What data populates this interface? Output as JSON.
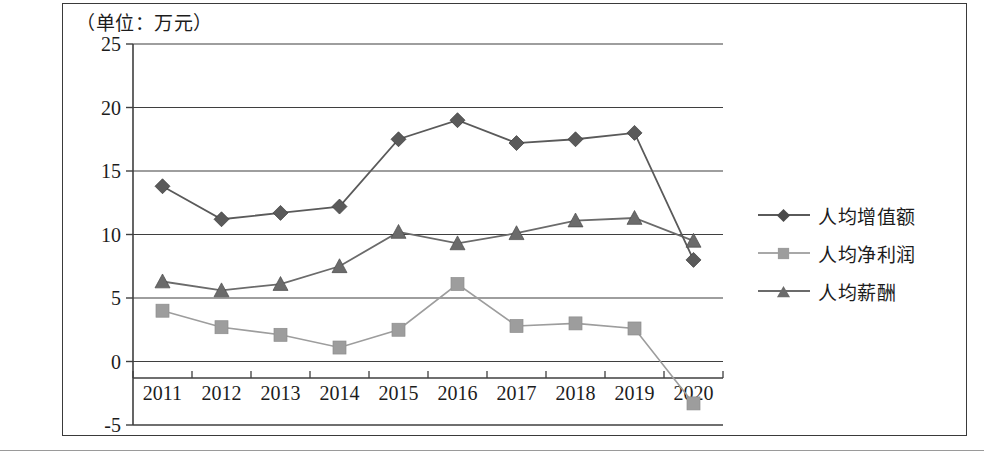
{
  "figure": {
    "unit_note": "（单位：万元）"
  },
  "chart_data": {
    "type": "line",
    "title": "",
    "subtitle": "",
    "xlabel": "",
    "ylabel": "",
    "unit": "万元",
    "categories": [
      "2011",
      "2012",
      "2013",
      "2014",
      "2015",
      "2016",
      "2017",
      "2018",
      "2019",
      "2020"
    ],
    "ylim": [
      -5,
      25
    ],
    "yticks": [
      "-5",
      "0",
      "5",
      "10",
      "15",
      "20",
      "25"
    ],
    "ytick_values": [
      -5,
      0,
      5,
      10,
      15,
      20,
      25
    ],
    "grid": true,
    "legend_position": "right",
    "series": [
      {
        "name": "人均增值额",
        "marker": "diamond",
        "color": "#5a5a5a",
        "values": [
          13.8,
          11.2,
          11.7,
          12.2,
          17.5,
          19.0,
          17.2,
          17.5,
          18.0,
          8.0
        ]
      },
      {
        "name": "人均净利润",
        "marker": "square",
        "color": "#9d9d9d",
        "values": [
          4.0,
          2.7,
          2.1,
          1.1,
          2.5,
          6.1,
          2.8,
          3.0,
          2.6,
          -3.3
        ]
      },
      {
        "name": "人均薪酬",
        "marker": "triangle",
        "color": "#6b6b6b",
        "values": [
          6.3,
          5.6,
          6.1,
          7.5,
          10.2,
          9.3,
          10.1,
          11.1,
          11.3,
          9.5
        ]
      }
    ]
  },
  "axes": {
    "x_labels": [
      "2011",
      "2012",
      "2013",
      "2014",
      "2015",
      "2016",
      "2017",
      "2018",
      "2019",
      "2020"
    ],
    "y_labels": [
      "25",
      "20",
      "15",
      "10",
      "5",
      "0",
      "-5"
    ]
  },
  "legend": {
    "items": [
      {
        "label": "人均增值额",
        "marker": "diamond-icon"
      },
      {
        "label": "人均净利润",
        "marker": "square-icon"
      },
      {
        "label": "人均薪酬",
        "marker": "triangle-icon"
      }
    ]
  }
}
